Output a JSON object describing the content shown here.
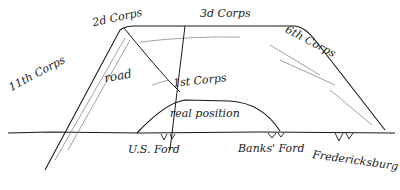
{
  "map": {
    "style": "hand-drawn pencil sketch",
    "ink_color": "#1a1a1a",
    "faint_color": "#8a8a8a",
    "background": "#ffffff",
    "labels": {
      "corps_2d": "2d Corps",
      "corps_3d": "3d Corps",
      "corps_6th": "6th Corps",
      "corps_11th": "11th Corps",
      "road": "road",
      "corps_1st": "1st Corps",
      "real_position": "real position",
      "us_ford": "U.S. Ford",
      "banks_ford": "Banks' Ford",
      "fredericksburg": "Fredericksburg"
    }
  }
}
